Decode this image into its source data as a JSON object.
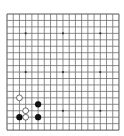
{
  "board": {
    "size": 19,
    "origin_x": 7,
    "origin_y": 14,
    "spacing_x": 6.22,
    "spacing_y": 6.45,
    "line_color": "#6e6e6e",
    "background": "#ffffff",
    "star_points": [
      [
        3,
        3
      ],
      [
        9,
        3
      ],
      [
        15,
        3
      ],
      [
        3,
        9
      ],
      [
        9,
        9
      ],
      [
        15,
        9
      ],
      [
        3,
        15
      ],
      [
        9,
        15
      ],
      [
        15,
        15
      ]
    ]
  },
  "stones": [
    {
      "color": "white",
      "col": 2,
      "row": 13
    },
    {
      "color": "black",
      "col": 5,
      "row": 14
    },
    {
      "color": "white",
      "col": 3,
      "row": 15
    },
    {
      "color": "black",
      "col": 2,
      "row": 16
    },
    {
      "color": "white",
      "col": 3,
      "row": 16
    },
    {
      "color": "black",
      "col": 5,
      "row": 16
    }
  ]
}
